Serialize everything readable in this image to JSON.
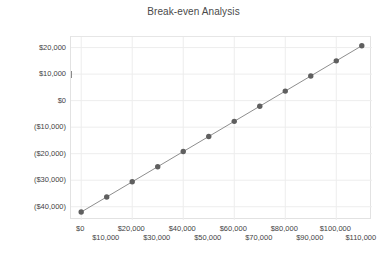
{
  "chart": {
    "title": "Break-even Analysis",
    "type": "line"
  },
  "axes": {
    "y_ticks": [
      "$20,000",
      "$10,000",
      "$0",
      "($10,000)",
      "($20,000)",
      "($30,000)",
      "($40,000)"
    ],
    "x_ticks": [
      "$0",
      "$10,000",
      "$20,000",
      "$30,000",
      "$40,000",
      "$50,000",
      "$60,000",
      "$70,000",
      "$80,000",
      "$90,000",
      "$100,000",
      "$110,000"
    ]
  },
  "style": {
    "marker_color": "#5f5f5f",
    "line_color": "#8e8e8e",
    "grid_color": "#ededed",
    "frame_color": "#e2e2e2",
    "text_color": "#3f3f3f",
    "title_color": "#4a4a4a"
  },
  "chart_data": {
    "type": "line",
    "title": "Break-even Analysis",
    "xlabel": "",
    "ylabel": "",
    "x": [
      0,
      10000,
      20000,
      30000,
      40000,
      50000,
      60000,
      70000,
      80000,
      90000,
      100000,
      110000
    ],
    "values": [
      -42000,
      -36300,
      -30600,
      -24900,
      -19200,
      -13500,
      -7800,
      -2100,
      3600,
      9300,
      15000,
      20700
    ],
    "xlim": [
      -4000,
      114000
    ],
    "ylim": [
      -45000,
      24000
    ],
    "x_tick_values": [
      0,
      10000,
      20000,
      30000,
      40000,
      50000,
      60000,
      70000,
      80000,
      90000,
      100000,
      110000
    ],
    "y_tick_values": [
      20000,
      10000,
      0,
      -10000,
      -20000,
      -30000,
      -40000
    ],
    "x_tick_labels": [
      "$0",
      "$10,000",
      "$20,000",
      "$30,000",
      "$40,000",
      "$50,000",
      "$60,000",
      "$70,000",
      "$80,000",
      "$90,000",
      "$100,000",
      "$110,000"
    ],
    "y_tick_labels": [
      "$20,000",
      "$10,000",
      "$0",
      "($10,000)",
      "($20,000)",
      "($30,000)",
      "($40,000)"
    ],
    "grid": true,
    "legend": null,
    "markers": true,
    "marker_shape": "circle",
    "series": [
      {
        "name": "Profit",
        "values": [
          -42000,
          -36300,
          -30600,
          -24900,
          -19200,
          -13500,
          -7800,
          -2100,
          3600,
          9300,
          15000,
          20700
        ]
      }
    ],
    "break_even_x": 73700
  }
}
